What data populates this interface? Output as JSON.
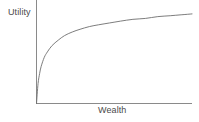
{
  "figure": {
    "background_color": "#ffffff",
    "width": 199,
    "height": 122
  },
  "chart_data": {
    "type": "line",
    "title": "",
    "subtitle": "",
    "xlabel": "Wealth",
    "ylabel": "Utility",
    "grid": false,
    "legend": null,
    "annotations": [],
    "xlim": [
      0,
      100
    ],
    "ylim": [
      0,
      100
    ],
    "xticks": [],
    "yticks": [],
    "xticklabels": [],
    "yticklabels": [],
    "line_color": "#6e6e6e",
    "axis_color": "#8a8a8a",
    "series": [
      {
        "name": "Utility of wealth",
        "description": "Concave increasing curve showing diminishing marginal utility of wealth",
        "x": [
          0,
          1,
          2,
          3,
          5,
          7,
          10,
          14,
          18,
          23,
          28,
          34,
          40,
          47,
          54,
          62,
          70,
          78,
          86,
          93,
          100
        ],
        "y": [
          0,
          22,
          33,
          41,
          51,
          57,
          64,
          70,
          75,
          79,
          82,
          85,
          87,
          89,
          91,
          93,
          94,
          96,
          97,
          98,
          99
        ]
      }
    ]
  }
}
